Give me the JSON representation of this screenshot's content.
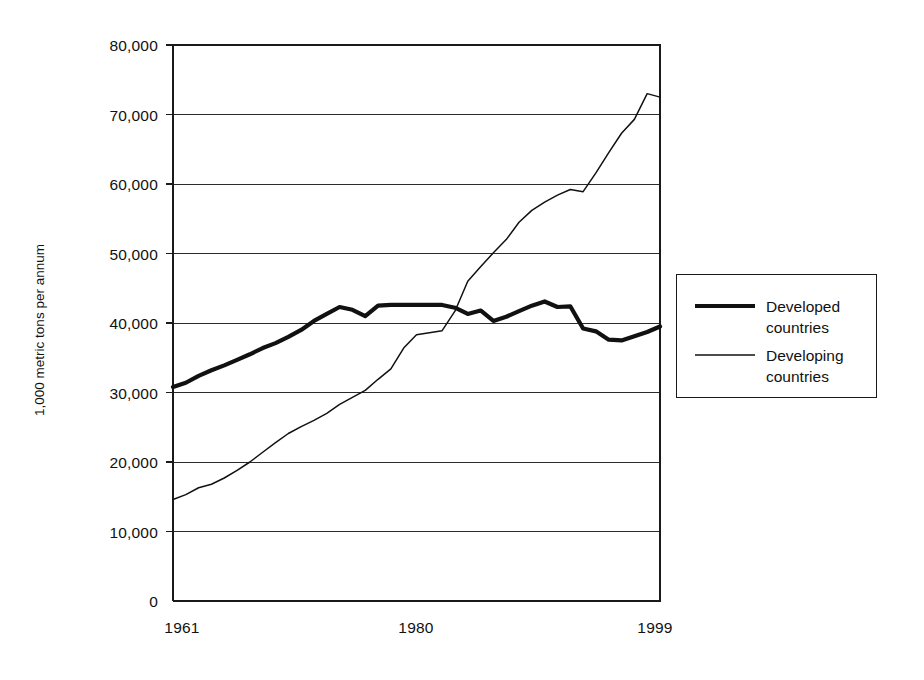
{
  "chart_data": {
    "type": "line",
    "title": "",
    "xlabel": "",
    "ylabel": "1,000 metric tons per annum",
    "xlim": [
      1961,
      1999
    ],
    "ylim": [
      0,
      80000
    ],
    "grid": true,
    "legend_position": "right",
    "y_ticks": [
      0,
      10000,
      20000,
      30000,
      40000,
      50000,
      60000,
      70000,
      80000
    ],
    "y_tick_labels": [
      "0",
      "10,000",
      "20,000",
      "30,000",
      "40,000",
      "50,000",
      "60,000",
      "70,000",
      "80,000"
    ],
    "x_ticks": [
      1961,
      1980,
      1999
    ],
    "x_tick_labels": [
      "1961",
      "1980",
      "1999"
    ],
    "x": [
      1961,
      1962,
      1963,
      1964,
      1965,
      1966,
      1967,
      1968,
      1969,
      1970,
      1971,
      1972,
      1973,
      1974,
      1975,
      1976,
      1977,
      1978,
      1979,
      1980,
      1981,
      1982,
      1983,
      1984,
      1985,
      1986,
      1987,
      1988,
      1989,
      1990,
      1991,
      1992,
      1993,
      1994,
      1995,
      1996,
      1997,
      1998,
      1999
    ],
    "series": [
      {
        "name": "Developed countries",
        "style": "thick",
        "values": [
          30800,
          31400,
          32400,
          33200,
          33900,
          34700,
          35500,
          36400,
          37100,
          38000,
          39000,
          40300,
          41300,
          42300,
          41900,
          41000,
          42500,
          42600,
          42600,
          42600,
          42600,
          42600,
          42200,
          41300,
          41800,
          40300,
          40900,
          41700,
          42500,
          43100,
          42300,
          42400,
          39200,
          38800,
          37600,
          37500,
          38100,
          38700,
          39500
        ]
      },
      {
        "name": "Developing countries",
        "style": "thin",
        "values": [
          14600,
          15300,
          16300,
          16800,
          17700,
          18800,
          20000,
          21400,
          22800,
          24100,
          25100,
          26000,
          27000,
          28300,
          29300,
          30300,
          31900,
          33400,
          36400,
          38300,
          38600,
          38900,
          41700,
          46000,
          48100,
          50100,
          52000,
          54500,
          56200,
          57400,
          58400,
          59200,
          58900,
          61600,
          64500,
          67300,
          69300,
          73000,
          72500
        ]
      }
    ]
  },
  "axes": {
    "y_axis_label": "1,000 metric tons per annum",
    "y_labels": [
      "80,000",
      "70,000",
      "60,000",
      "50,000",
      "40,000",
      "30,000",
      "20,000",
      "10,000",
      "0"
    ],
    "x_labels": [
      "1961",
      "1980",
      "1999"
    ]
  },
  "legend": {
    "entries": [
      {
        "label_line1": "Developed",
        "label_line2": "countries",
        "style": "thick"
      },
      {
        "label_line1": "Developing",
        "label_line2": "countries",
        "style": "thin"
      }
    ]
  },
  "colors": {
    "background": "#ffffff",
    "ink": "#111111",
    "gridline": "#2b2b2b",
    "frame": "#1a1a1a"
  }
}
